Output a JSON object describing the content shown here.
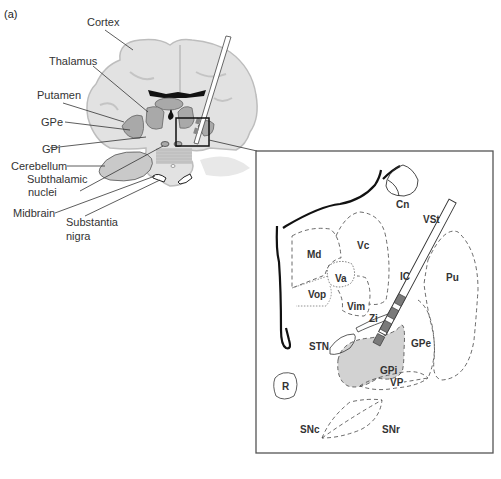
{
  "panel_label": "(a)",
  "overview_labels": {
    "cortex": "Cortex",
    "thalamus": "Thalamus",
    "putamen": "Putamen",
    "gpe": "GPe",
    "gpi": "GPi",
    "cerebellum": "Cerebellum",
    "subthalamic_1": "Subthalamic",
    "subthalamic_2": "nuclei",
    "midbrain": "Midbrain",
    "substantia_1": "Substantia",
    "substantia_2": "nigra"
  },
  "inset_labels": {
    "cn": "Cn",
    "vst": "VSt",
    "md": "Md",
    "vc": "Vc",
    "va": "Va",
    "vop": "Vop",
    "vim": "Vim",
    "ic": "IC",
    "pu": "Pu",
    "zi": "Zi",
    "stn": "STN",
    "gpe": "GPe",
    "gpi": "GPi",
    "vp": "VP",
    "r": "R",
    "snc": "SNc",
    "snr": "SNr"
  },
  "colors": {
    "brain_fill": "#dcdcdc",
    "nucleus_fill": "#a9a9a9",
    "gpi_fill": "#d2d2d2",
    "electrode_contact": "#7a7a7a",
    "outline": "#222222"
  }
}
